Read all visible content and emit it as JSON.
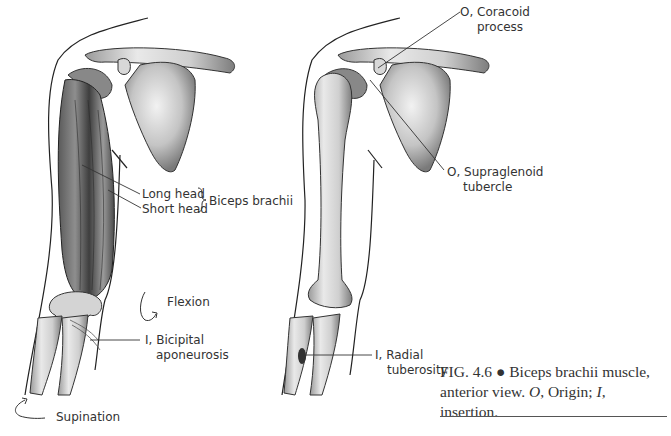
{
  "figure": {
    "left_view": {
      "labels": {
        "long_head": "Long head",
        "short_head": "Short head",
        "muscle": "Biceps brachii",
        "flexion": "Flexion",
        "insertion_line1": "I, Bicipital",
        "insertion_line2": "aponeurosis",
        "supination": "Supination"
      }
    },
    "right_view": {
      "labels": {
        "origin1_line1": "O, Coracoid",
        "origin1_line2": "process",
        "origin2_line1": "O, Supraglenoid",
        "origin2_line2": "tubercle",
        "insertion_line1": "I, Radial",
        "insertion_line2": "tuberosity"
      }
    },
    "caption": {
      "number": "FIG. 4.6",
      "bullet": "●",
      "text1": "Biceps brachii muscle,",
      "text2": "anterior view.",
      "o_abbr": "O",
      "o_def": ", Origin;",
      "i_abbr": "I",
      "i_def": ", insertion."
    }
  }
}
